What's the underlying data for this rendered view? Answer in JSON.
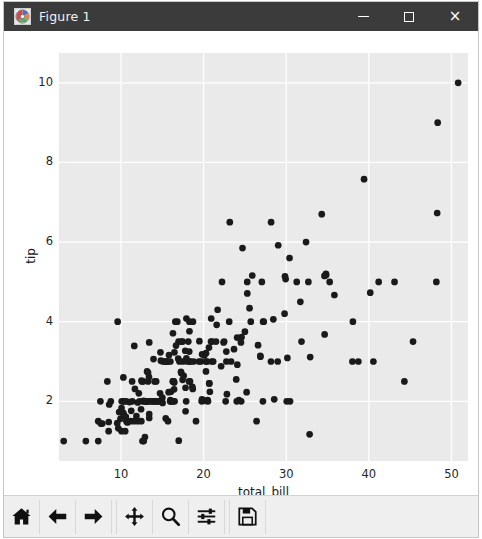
{
  "window": {
    "title": "Figure 1",
    "icon": "matplotlib-icon",
    "minimize_label": "",
    "maximize_label": "",
    "close_label": "×",
    "titlebar_color": "#3b3b3b",
    "titlebar_text_color": "#f2f2f2"
  },
  "toolbar": {
    "buttons": [
      {
        "name": "home-button",
        "icon": "home-icon",
        "tooltip": "Reset original view"
      },
      {
        "name": "back-button",
        "icon": "arrow-left-icon",
        "tooltip": "Back to previous view"
      },
      {
        "name": "forward-button",
        "icon": "arrow-right-icon",
        "tooltip": "Forward to next view"
      },
      {
        "name": "pan-button",
        "icon": "move-icon",
        "tooltip": "Pan axes with left mouse, zoom with right"
      },
      {
        "name": "zoom-button",
        "icon": "magnifier-icon",
        "tooltip": "Zoom to rectangle"
      },
      {
        "name": "configure-subplots-button",
        "icon": "sliders-icon",
        "tooltip": "Configure subplots"
      },
      {
        "name": "save-button",
        "icon": "floppy-disk-icon",
        "tooltip": "Save the figure"
      }
    ],
    "background_color": "#efefef"
  },
  "chart_data": {
    "type": "scatter",
    "title": "",
    "xlabel": "total_bill",
    "ylabel": "tip",
    "xlim": [
      2.5,
      52.0
    ],
    "ylim": [
      0.5,
      10.75
    ],
    "xticks": [
      10,
      20,
      30,
      40,
      50
    ],
    "yticks": [
      2,
      4,
      6,
      8,
      10
    ],
    "xtick_labels": [
      "10",
      "20",
      "30",
      "40",
      "50"
    ],
    "ytick_labels": [
      "2",
      "4",
      "6",
      "8",
      "10"
    ],
    "grid": true,
    "grid_color": "#ffffff",
    "axes_facecolor": "#eaeaea",
    "figure_facecolor": "#ffffff",
    "legend": null,
    "marker": "o",
    "marker_color": "#1a1a1a",
    "marker_size": 5.2,
    "n_points": 244,
    "series": [
      {
        "name": "tips",
        "x": [
          16.99,
          10.34,
          21.01,
          23.68,
          24.59,
          25.29,
          8.77,
          26.88,
          15.04,
          14.78,
          10.27,
          35.26,
          15.42,
          18.43,
          14.83,
          21.58,
          10.33,
          16.29,
          16.97,
          20.65,
          17.92,
          20.29,
          15.77,
          39.42,
          19.82,
          17.81,
          13.37,
          12.69,
          21.7,
          19.65,
          9.55,
          18.35,
          15.06,
          20.69,
          17.78,
          24.06,
          16.31,
          16.93,
          18.69,
          31.27,
          16.04,
          17.46,
          13.94,
          9.68,
          30.4,
          18.29,
          22.23,
          32.4,
          28.55,
          18.04,
          12.54,
          10.29,
          34.81,
          9.94,
          25.56,
          19.49,
          38.01,
          26.41,
          11.24,
          48.27,
          20.29,
          13.81,
          11.02,
          18.29,
          17.59,
          20.08,
          16.45,
          3.07,
          20.23,
          15.01,
          12.02,
          17.07,
          26.86,
          25.28,
          14.73,
          10.51,
          17.92,
          27.2,
          22.76,
          17.29,
          19.44,
          16.66,
          10.07,
          32.68,
          15.98,
          34.83,
          13.03,
          18.28,
          24.71,
          21.16,
          28.97,
          22.49,
          5.75,
          16.32,
          22.75,
          40.17,
          27.28,
          12.03,
          21.01,
          12.46,
          11.35,
          15.38,
          44.3,
          22.42,
          20.92,
          15.36,
          20.49,
          25.21,
          18.24,
          14.31,
          14.0,
          7.25,
          38.07,
          23.95,
          25.71,
          17.31,
          29.93,
          10.65,
          12.43,
          24.08,
          11.69,
          13.42,
          14.26,
          15.95,
          12.48,
          29.8,
          8.52,
          14.52,
          11.38,
          22.82,
          19.08,
          20.27,
          11.17,
          12.26,
          18.26,
          8.51,
          10.33,
          14.15,
          16.0,
          13.16,
          17.47,
          34.3,
          41.19,
          27.05,
          16.43,
          8.35,
          18.64,
          11.87,
          9.78,
          7.51,
          14.07,
          13.13,
          17.26,
          24.55,
          19.77,
          29.85,
          48.17,
          25.0,
          13.39,
          16.49,
          21.5,
          12.66,
          16.21,
          13.81,
          17.51,
          24.52,
          20.76,
          31.71,
          10.59,
          10.63,
          50.81,
          15.81,
          7.25,
          31.85,
          16.82,
          32.9,
          17.89,
          14.48,
          9.6,
          34.63,
          34.65,
          23.33,
          45.35,
          23.17,
          40.55,
          20.69,
          20.9,
          30.46,
          18.15,
          23.1,
          15.69,
          19.81,
          28.44,
          15.48,
          16.58,
          7.56,
          10.34,
          43.11,
          13.0,
          13.51,
          18.71,
          12.74,
          13.0,
          16.4,
          20.53,
          16.47,
          26.59,
          38.73,
          24.27,
          12.76,
          30.06,
          25.89,
          48.33,
          13.27,
          28.17,
          12.9,
          28.15,
          11.59,
          7.74,
          30.14,
          12.16,
          13.42,
          8.58,
          15.98,
          13.42,
          16.27,
          10.09,
          20.45,
          13.28,
          22.12,
          24.01,
          15.69,
          11.61,
          10.77,
          15.53,
          10.07,
          12.6,
          32.83,
          35.83,
          29.03,
          27.18,
          22.67,
          17.82,
          18.78
        ],
        "y": [
          1.01,
          1.66,
          3.5,
          3.31,
          3.61,
          4.71,
          2.0,
          3.12,
          1.96,
          3.23,
          1.71,
          5.0,
          1.57,
          3.0,
          3.02,
          3.92,
          1.67,
          3.71,
          3.5,
          3.35,
          4.08,
          2.75,
          2.23,
          7.58,
          3.18,
          2.34,
          2.0,
          2.0,
          4.3,
          3.0,
          1.45,
          2.5,
          3.0,
          2.45,
          3.27,
          3.6,
          2.0,
          3.07,
          2.31,
          5.0,
          2.24,
          2.54,
          3.06,
          1.32,
          5.6,
          3.0,
          5.0,
          6.0,
          2.05,
          3.0,
          2.5,
          2.6,
          5.2,
          1.56,
          4.34,
          3.51,
          3.0,
          1.5,
          1.76,
          6.73,
          3.21,
          2.0,
          1.98,
          3.76,
          2.64,
          3.15,
          2.47,
          1.0,
          2.01,
          2.09,
          1.97,
          3.0,
          3.14,
          5.0,
          2.2,
          1.25,
          3.08,
          4.0,
          3.0,
          2.71,
          3.0,
          3.4,
          1.83,
          5.0,
          2.03,
          5.17,
          2.0,
          4.0,
          5.85,
          3.0,
          3.0,
          3.5,
          1.0,
          2.5,
          3.25,
          4.73,
          4.0,
          1.5,
          3.0,
          1.5,
          2.5,
          3.0,
          2.5,
          3.48,
          4.08,
          3.0,
          2.03,
          2.23,
          2.5,
          2.0,
          2.0,
          1.0,
          4.0,
          2.55,
          4.0,
          3.5,
          5.07,
          1.5,
          1.8,
          2.92,
          2.31,
          1.68,
          2.5,
          2.0,
          2.52,
          4.2,
          1.48,
          2.0,
          2.0,
          2.18,
          1.5,
          3.0,
          1.5,
          2.0,
          3.25,
          1.25,
          2.0,
          2.0,
          2.0,
          2.75,
          3.5,
          6.7,
          5.0,
          5.0,
          2.3,
          2.5,
          2.36,
          1.63,
          1.73,
          2.0,
          2.5,
          2.0,
          2.74,
          2.0,
          2.0,
          5.14,
          5.0,
          3.75,
          2.61,
          2.0,
          3.5,
          2.5,
          2.0,
          2.0,
          3.0,
          3.48,
          2.24,
          4.5,
          1.61,
          2.0,
          10.0,
          3.16,
          1.5,
          3.5,
          4.0,
          3.11,
          2.0,
          2.0,
          4.0,
          5.15,
          3.68,
          3.0,
          3.5,
          6.5,
          3.0,
          2.45,
          3.5,
          2.0,
          3.5,
          4.0,
          1.5,
          2.05,
          4.06,
          3.0,
          4.0,
          1.44,
          2.0,
          5.0,
          2.0,
          2.0,
          4.0,
          2.01,
          2.0,
          2.5,
          2.0,
          3.23,
          3.41,
          3.0,
          2.03,
          1.0,
          2.0,
          5.16,
          9.0,
          2.5,
          6.5,
          1.1,
          3.0,
          1.5,
          1.44,
          3.09,
          2.2,
          3.48,
          1.92,
          3.0,
          1.58,
          2.5,
          2.0,
          3.0,
          2.72,
          2.88,
          2.0,
          3.0,
          3.39,
          1.47,
          3.0,
          1.25,
          1.0,
          1.17,
          4.67,
          5.92,
          2.0,
          2.0,
          1.75,
          3.0
        ]
      }
    ]
  }
}
